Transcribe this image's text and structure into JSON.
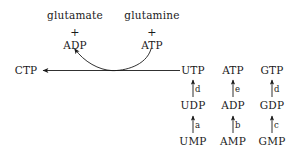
{
  "diagram": {
    "background_color": "#ffffff",
    "stroke_color": "#1a1a1a",
    "text_color": "#1a1a1a",
    "width": 295,
    "height": 161
  },
  "ctp_reaction": {
    "product": "CTP",
    "substrate": "UTP",
    "cosubstrate_label": "glutamine",
    "cosubstrate_energy": "ATP",
    "coproduct_label": "glutamate",
    "coproduct_energy": "ADP",
    "plus_left": "+",
    "plus_right": "+"
  },
  "columns": [
    {
      "name": "uridine",
      "triphosphate": "UTP",
      "diphosphate": "UDP",
      "monophosphate": "UMP",
      "enzyme_di_to_tri": "d",
      "enzyme_mono_to_di": "a"
    },
    {
      "name": "adenosine",
      "triphosphate": "ATP",
      "diphosphate": "ADP",
      "monophosphate": "AMP",
      "enzyme_di_to_tri": "e",
      "enzyme_mono_to_di": "b"
    },
    {
      "name": "guanosine",
      "triphosphate": "GTP",
      "diphosphate": "GDP",
      "monophosphate": "GMP",
      "enzyme_di_to_tri": "d",
      "enzyme_mono_to_di": "c"
    }
  ]
}
